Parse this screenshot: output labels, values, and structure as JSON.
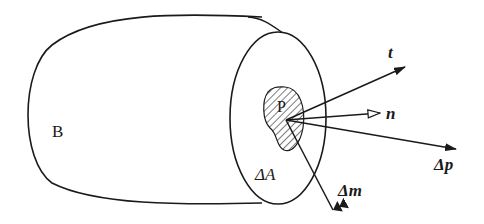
{
  "diagram": {
    "type": "stress-vector-on-body-section",
    "labels": {
      "body": "B",
      "point": "P",
      "area": "ΔA",
      "traction": "t",
      "normal": "n",
      "force": "Δp",
      "moment": "Δm"
    },
    "colors": {
      "stroke": "#1a1a1a",
      "background": "#ffffff"
    }
  }
}
